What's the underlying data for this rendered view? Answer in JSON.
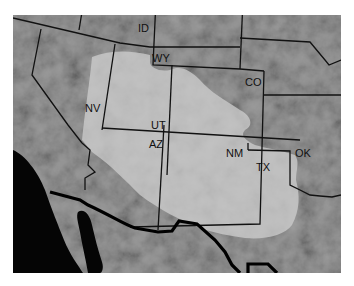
{
  "map": {
    "type": "regional map",
    "style": "grayscale shaded relief with state boundaries and shaded region overlay",
    "colors": {
      "terrain": "#8a8a8a",
      "overlay_region": "#c4c4c4",
      "ocean": "#000000",
      "border_lines": "#111111",
      "background": "#ffffff"
    },
    "state_labels": [
      {
        "id": "ID",
        "text": "ID",
        "x": 138,
        "y": 32
      },
      {
        "id": "WY",
        "text": "WY",
        "x": 152,
        "y": 62
      },
      {
        "id": "CO",
        "text": "CO",
        "x": 245,
        "y": 86
      },
      {
        "id": "NV",
        "text": "NV",
        "x": 85,
        "y": 112
      },
      {
        "id": "UT",
        "text": "UT",
        "x": 151,
        "y": 129
      },
      {
        "id": "AZ",
        "text": "AZ",
        "x": 149,
        "y": 148
      },
      {
        "id": "NM",
        "text": "NM",
        "x": 226,
        "y": 157
      },
      {
        "id": "TX",
        "text": "TX",
        "x": 256,
        "y": 171
      },
      {
        "id": "OK",
        "text": "OK",
        "x": 295,
        "y": 157
      }
    ]
  }
}
